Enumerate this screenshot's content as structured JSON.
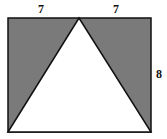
{
  "diagram": {
    "type": "geometry",
    "labels": {
      "top_left_segment": "7",
      "top_right_segment": "7",
      "right_side": "8"
    },
    "colors": {
      "shade": "#7a7a7a",
      "stroke": "#111111",
      "triangle_fill": "#ffffff"
    }
  }
}
